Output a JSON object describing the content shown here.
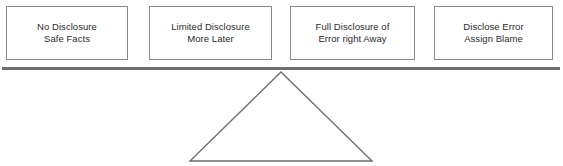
{
  "diagram": {
    "type": "seesaw-balance-spectrum",
    "background_color": "#ffffff",
    "beam": {
      "name": "balance-beam",
      "color": "#6e6e6e",
      "x": 2,
      "y": 67,
      "width": 558,
      "height": 3
    },
    "fulcrum": {
      "name": "fulcrum-triangle",
      "shape": "triangle",
      "stroke_color": "#6e6e6e",
      "fill": "none",
      "apex": {
        "x": 281,
        "y": 72
      },
      "base_left": {
        "x": 190,
        "y": 161
      },
      "base_right": {
        "x": 372,
        "y": 161
      }
    },
    "options": [
      {
        "id": "no-disclosure",
        "lines": [
          "No Disclosure",
          "Safe Facts"
        ],
        "line1": "No Disclosure",
        "line2": "Safe Facts",
        "border_color": "#8a8a8a",
        "text_color": "#2b2b2b",
        "fill": "#ffffff"
      },
      {
        "id": "limited-disclosure",
        "lines": [
          "Limited Disclosure",
          "More Later"
        ],
        "line1": "Limited Disclosure",
        "line2": "More Later",
        "border_color": "#8a8a8a",
        "text_color": "#2b2b2b",
        "fill": "#ffffff"
      },
      {
        "id": "full-disclosure",
        "lines": [
          "Full Disclosure of",
          "Error right Away"
        ],
        "line1": "Full Disclosure of",
        "line2": "Error right Away",
        "border_color": "#8a8a8a",
        "text_color": "#2b2b2b",
        "fill": "#ffffff"
      },
      {
        "id": "disclose-assign-blame",
        "lines": [
          "Disclose Error",
          "Assign Blame"
        ],
        "line1": "Disclose Error",
        "line2": "Assign Blame",
        "border_color": "#8a8a8a",
        "text_color": "#2b2b2b",
        "fill": "#ffffff"
      }
    ]
  }
}
